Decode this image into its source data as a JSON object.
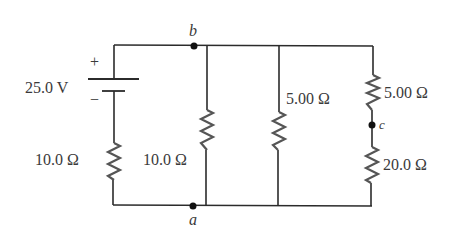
{
  "diagram": {
    "type": "circuit",
    "colors": {
      "wire": "#2b2b2b",
      "resistor": "#555555",
      "text": "#3a3a3a",
      "node": "#111111"
    },
    "battery": {
      "voltage_label": "25.0 V",
      "plus": "+",
      "minus": "−"
    },
    "resistors": [
      {
        "id": "R1",
        "label": "10.0 Ω",
        "branch": "left (series with battery)"
      },
      {
        "id": "R2",
        "label": "10.0 Ω",
        "branch": "between b and a"
      },
      {
        "id": "R3",
        "label": "5.00 Ω",
        "branch": "middle parallel"
      },
      {
        "id": "R4",
        "label": "5.00 Ω",
        "branch": "right upper (b to c)"
      },
      {
        "id": "R5",
        "label": "20.0 Ω",
        "branch": "right lower (c to a)"
      }
    ],
    "nodes": [
      {
        "id": "b",
        "label": "b"
      },
      {
        "id": "a",
        "label": "a"
      },
      {
        "id": "c",
        "label": "c"
      }
    ]
  }
}
